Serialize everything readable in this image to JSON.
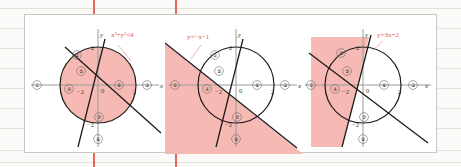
{
  "page": {
    "background_color": "#fbfaf8",
    "rule_color": "#e3e0db",
    "frame_color": "#ffffff",
    "accent_color": "#e05a50",
    "shade_color": "#f7b9b4"
  },
  "panels": [
    {
      "id": "panel-1",
      "equation": "x²+y²<4",
      "shade_description": "interior of circle",
      "axis_labels": {
        "x": "x",
        "y": "y"
      },
      "ticks": {
        "x_neg": "−2",
        "x_pos": "2",
        "y_pos": "2",
        "y_neg": "−2",
        "origin": "0"
      },
      "regions": [
        {
          "n": "①",
          "x": 12,
          "y": 70
        },
        {
          "n": "②",
          "x": 52,
          "y": 40
        },
        {
          "n": "③",
          "x": 122,
          "y": 70
        },
        {
          "n": "④",
          "x": 44,
          "y": 74
        },
        {
          "n": "⑤",
          "x": 56,
          "y": 56
        },
        {
          "n": "⑥",
          "x": 88,
          "y": 70
        },
        {
          "n": "⑦",
          "x": 74,
          "y": 102
        },
        {
          "n": "⑧",
          "x": 73,
          "y": 124
        }
      ]
    },
    {
      "id": "panel-2",
      "equation": "y<−x−1",
      "shade_description": "half-plane below line y=-x-1",
      "axis_labels": {
        "x": "x",
        "y": "y"
      },
      "ticks": {
        "x_neg": "−2",
        "x_pos": "2",
        "y_pos": "2",
        "y_neg": "−2",
        "origin": "0"
      },
      "regions": [
        {
          "n": "①",
          "x": 12,
          "y": 70
        },
        {
          "n": "②",
          "x": 52,
          "y": 40
        },
        {
          "n": "③",
          "x": 122,
          "y": 70
        },
        {
          "n": "④",
          "x": 44,
          "y": 74
        },
        {
          "n": "⑤",
          "x": 56,
          "y": 56
        },
        {
          "n": "⑥",
          "x": 88,
          "y": 70
        },
        {
          "n": "⑦",
          "x": 74,
          "y": 102
        },
        {
          "n": "⑧",
          "x": 73,
          "y": 124
        }
      ]
    },
    {
      "id": "panel-3",
      "equation": "y>3x+2",
      "shade_description": "half-plane left of line y=3x+2",
      "axis_labels": {
        "x": "x",
        "y": "y"
      },
      "ticks": {
        "x_neg": "−2",
        "x_pos": "2",
        "y_pos": "2",
        "y_neg": "−2",
        "origin": "0"
      },
      "regions": [
        {
          "n": "①",
          "x": 12,
          "y": 70
        },
        {
          "n": "②",
          "x": 52,
          "y": 40
        },
        {
          "n": "③",
          "x": 122,
          "y": 70
        },
        {
          "n": "④",
          "x": 44,
          "y": 74
        },
        {
          "n": "⑤",
          "x": 56,
          "y": 56
        },
        {
          "n": "⑥",
          "x": 88,
          "y": 70
        },
        {
          "n": "⑦",
          "x": 74,
          "y": 102
        },
        {
          "n": "⑧",
          "x": 73,
          "y": 124
        }
      ]
    }
  ]
}
